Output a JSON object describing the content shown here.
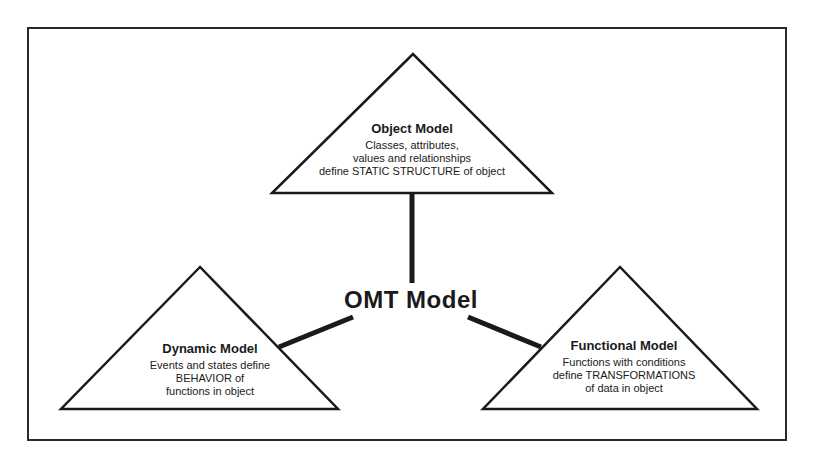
{
  "diagram": {
    "center": {
      "title": "OMT Model"
    },
    "nodes": [
      {
        "id": "object",
        "title": "Object Model",
        "lines": [
          "Classes, attributes,",
          "values and relationships",
          "define STATIC STRUCTURE of object"
        ]
      },
      {
        "id": "dynamic",
        "title": "Dynamic Model",
        "lines": [
          "Events and states define",
          "BEHAVIOR of",
          "functions in object"
        ]
      },
      {
        "id": "functional",
        "title": "Functional Model",
        "lines": [
          "Functions with conditions",
          "define TRANSFORMATIONS",
          "of data in object"
        ]
      }
    ],
    "colors": {
      "stroke": "#1a1a1a",
      "background": "#ffffff"
    }
  }
}
